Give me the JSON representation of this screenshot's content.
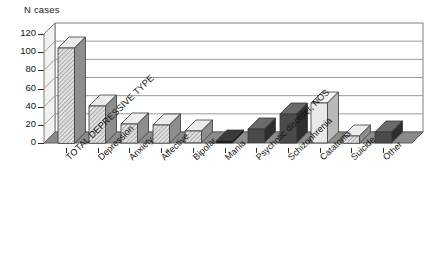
{
  "chart_data": {
    "type": "bar",
    "title": "",
    "subtitle": "",
    "ylabel": "N cases",
    "xlabel": "",
    "ylim": [
      0,
      120
    ],
    "yticks": [
      0,
      20,
      40,
      60,
      80,
      100,
      120
    ],
    "grid": true,
    "legend": "none",
    "style": "3d-bar",
    "categories": [
      "TOTAL DEPRESSIVE TYPE",
      "Depression",
      "Anxiety",
      "Affective",
      "Bipolar",
      "Mania",
      "Psychotic disorder, NOS",
      "Schizophrenia",
      "Catatonia",
      "Suicide",
      "Other"
    ],
    "values": [
      105,
      41,
      21,
      20,
      13,
      2,
      15,
      32,
      44,
      8,
      12
    ],
    "bar_fills": [
      "hatch-light",
      "hatch-light",
      "hatch-light",
      "hatch-light",
      "hatch-light",
      "solid-black",
      "solid-dark",
      "solid-dark",
      "solid-pale",
      "hatch-light",
      "solid-dark"
    ]
  },
  "colors": {
    "axis": "#2b2b2b",
    "grid": "#9a9a9a",
    "frame": "#7d7d7d",
    "bar_light": "#d6d6d6",
    "bar_light_side": "#8e8e8e",
    "bar_dark": "#4a4a4a",
    "bar_dark_side": "#2e2e2e",
    "bar_pale": "#e8e8e8",
    "bar_pale_side": "#b9b9b9",
    "bar_black": "#0d0d0d",
    "floor": "#8b8b8b",
    "background": "#ffffff",
    "text": "#141414"
  }
}
